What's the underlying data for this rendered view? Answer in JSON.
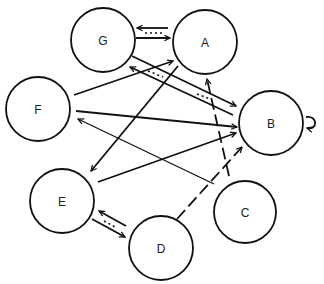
{
  "diagram": {
    "type": "directed-graph",
    "nodes": [
      {
        "id": "G",
        "label": "G",
        "x": 103,
        "y": 40,
        "r": 32
      },
      {
        "id": "A",
        "label": "A",
        "x": 205,
        "y": 42,
        "r": 32
      },
      {
        "id": "F",
        "label": "F",
        "x": 38,
        "y": 109,
        "r": 32
      },
      {
        "id": "B",
        "label": "B",
        "x": 271,
        "y": 123,
        "r": 32
      },
      {
        "id": "E",
        "label": "E",
        "x": 62,
        "y": 201,
        "r": 32
      },
      {
        "id": "C",
        "label": "C",
        "x": 245,
        "y": 212,
        "r": 31
      },
      {
        "id": "D",
        "label": "D",
        "x": 161,
        "y": 248,
        "r": 32
      }
    ],
    "edges": [
      {
        "from": "G",
        "to": "A",
        "style": "solid",
        "bidirectional_pair": "A-G dotted"
      },
      {
        "from": "A",
        "to": "G",
        "style": "dotted-double"
      },
      {
        "from": "F",
        "to": "A",
        "style": "solid"
      },
      {
        "from": "A",
        "to": "E",
        "style": "solid"
      },
      {
        "from": "G",
        "to": "B",
        "style": "solid"
      },
      {
        "from": "B",
        "to": "G",
        "style": "dotted-double"
      },
      {
        "from": "F",
        "to": "B",
        "style": "solid"
      },
      {
        "from": "E",
        "to": "B",
        "style": "solid"
      },
      {
        "from": "C",
        "to": "F",
        "style": "thin"
      },
      {
        "from": "C",
        "to": "A",
        "style": "dashed"
      },
      {
        "from": "D",
        "to": "B",
        "style": "dashed"
      },
      {
        "from": "E",
        "to": "D",
        "style": "solid"
      },
      {
        "from": "D",
        "to": "E",
        "style": "dotted-double"
      },
      {
        "from": "B",
        "to": "B",
        "style": "self-loop"
      }
    ]
  }
}
